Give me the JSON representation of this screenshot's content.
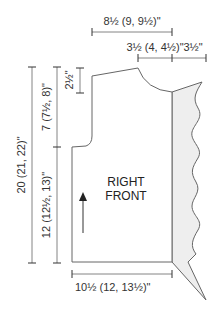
{
  "diagram": {
    "piece_label_line1": "RIGHT",
    "piece_label_line2": "FRONT",
    "colors": {
      "line": "#666666",
      "band_fill": "#eeeeee",
      "text": "#333333"
    },
    "dimensions": {
      "top_width": "8½ (9, 9½)\"",
      "shoulder_width": "3½ (4, 4½)\"",
      "band_width": "3½\"",
      "total_length": "20 (21, 22)\"",
      "armhole_depth": "7 (7½, 8)\"",
      "side_length": "12 (12½, 13)\"",
      "shoulder_drop": "2½\"",
      "bottom_width": "10½ (12, 13½)\""
    },
    "icons": {
      "grain_arrow": "up-arrow"
    }
  }
}
